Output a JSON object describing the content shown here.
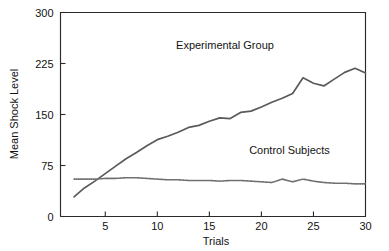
{
  "chart_data": {
    "type": "line",
    "title": "",
    "xlabel": "Trials",
    "ylabel": "Mean Shock Level",
    "xlim": [
      0.7,
      30
    ],
    "ylim": [
      0,
      300
    ],
    "xticks": [
      5,
      10,
      15,
      20,
      25,
      30
    ],
    "yticks": [
      0,
      75,
      150,
      225,
      300
    ],
    "xtick_labels": [
      "5",
      "10",
      "15",
      "20",
      "25",
      "30"
    ],
    "ytick_labels": [
      "0",
      "75",
      "150",
      "225",
      "300"
    ],
    "grid": false,
    "legend_position": "inline-annotations",
    "x": [
      2,
      3,
      4,
      5,
      6,
      7,
      8,
      9,
      10,
      11,
      12,
      13,
      14,
      15,
      16,
      17,
      18,
      19,
      20,
      21,
      22,
      23,
      24,
      25,
      26,
      27,
      28,
      29,
      30
    ],
    "series": [
      {
        "name": "Experimental Group",
        "style": "solid",
        "color": "#5a5a5a",
        "values": [
          29,
          42,
          52,
          63,
          74,
          85,
          94,
          104,
          113,
          118,
          124,
          131,
          134,
          140,
          145,
          144,
          153,
          155,
          161,
          168,
          174,
          181,
          204,
          196,
          192,
          202,
          212,
          218,
          211
        ]
      },
      {
        "name": "Control Subjects",
        "style": "dotted",
        "color": "#6e6e6e",
        "values": [
          55,
          55,
          55,
          56,
          56,
          57,
          57,
          56,
          55,
          54,
          54,
          53,
          53,
          53,
          52,
          53,
          53,
          52,
          51,
          50,
          55,
          51,
          55,
          52,
          50,
          49,
          49,
          48,
          48
        ]
      }
    ],
    "annotations": [
      {
        "text": "Experimental Group",
        "x": 16.5,
        "y": 246
      },
      {
        "text": "Control Subjects",
        "x": 22.7,
        "y": 92
      }
    ]
  }
}
